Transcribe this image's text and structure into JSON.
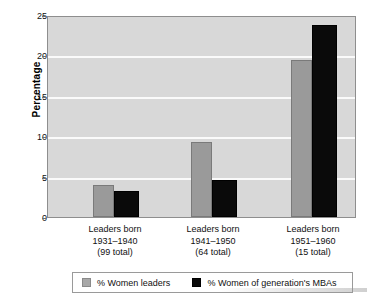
{
  "chart_data": {
    "type": "bar",
    "title": "",
    "xlabel": "",
    "ylabel": "Percentage",
    "ylim": [
      0,
      25
    ],
    "yticks": [
      0,
      5,
      10,
      15,
      20,
      25
    ],
    "grid": true,
    "legend_position": "bottom",
    "categories": [
      "Leaders born\n1931–1940\n(99 total)",
      "Leaders born\n1941–1950\n(64 total)",
      "Leaders born\n1951–1960\n(15 total)"
    ],
    "category_lines": [
      {
        "line1": "Leaders born",
        "line2": "1931–1940",
        "line3": "(99 total)"
      },
      {
        "line1": "Leaders born",
        "line2": "1941–1950",
        "line3": "(64 total)"
      },
      {
        "line1": "Leaders born",
        "line2": "1951–1960",
        "line3": "(15 total)"
      }
    ],
    "series": [
      {
        "name": "% Women leaders",
        "color": "#9a9a9a",
        "values": [
          4.0,
          9.3,
          19.4
        ]
      },
      {
        "name": "% Women of generation's MBAs",
        "color": "#0a0a0a",
        "values": [
          3.2,
          4.6,
          23.8
        ]
      }
    ]
  },
  "axis": {
    "ytick_labels": [
      "0",
      "5",
      "10",
      "15",
      "20",
      "25"
    ]
  },
  "legend": {
    "items": [
      {
        "label": "% Women leaders",
        "swatch": "gray-square-icon"
      },
      {
        "label": "% Women of generation's MBAs",
        "swatch": "black-square-icon"
      }
    ]
  },
  "footer": {
    "artifact_text": ""
  },
  "colors": {
    "plot_background": "#d8d8d8",
    "gridline": "#fafafa",
    "series_leaders": "#9a9a9a",
    "series_mbas": "#0a0a0a",
    "axis_line": "#8e8e8e",
    "text": "#111111"
  }
}
